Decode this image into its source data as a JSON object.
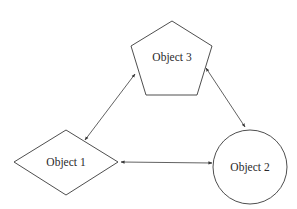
{
  "diagram": {
    "type": "object-relationship",
    "nodes": [
      {
        "id": "object1",
        "label": "Object 1",
        "shape": "diamond"
      },
      {
        "id": "object2",
        "label": "Object 2",
        "shape": "circle"
      },
      {
        "id": "object3",
        "label": "Object 3",
        "shape": "pentagon"
      }
    ],
    "edges": [
      {
        "from": "object1",
        "to": "object3",
        "direction": "bidirectional"
      },
      {
        "from": "object3",
        "to": "object2",
        "direction": "bidirectional"
      },
      {
        "from": "object1",
        "to": "object2",
        "direction": "bidirectional"
      }
    ],
    "colors": {
      "stroke": "#3a3a3a",
      "background": "#ffffff",
      "text": "#2a2a2a"
    }
  }
}
